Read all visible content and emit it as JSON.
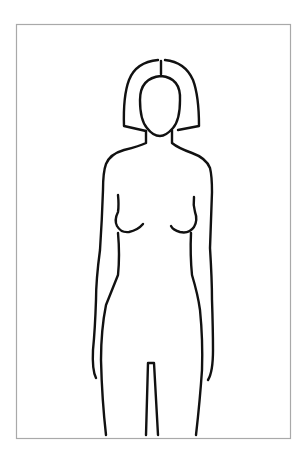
{
  "diagram": {
    "type": "body-outline",
    "colors": {
      "background": "#ffffff",
      "frame": "#a9a9a9",
      "line": "#111111"
    },
    "parts": [
      "hair",
      "face",
      "neck",
      "shoulders",
      "arms",
      "chest",
      "torso",
      "legs"
    ]
  }
}
